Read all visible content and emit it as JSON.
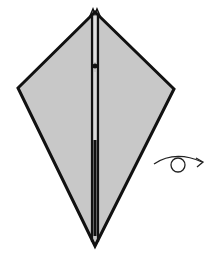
{
  "diagram": {
    "type": "origami-step",
    "paper_color": "#c8c8c8",
    "outline_color": "#111111",
    "background": "#ffffff",
    "kite": {
      "top": [
        95,
        12
      ],
      "left": [
        18,
        88
      ],
      "right": [
        174,
        89
      ],
      "bottom": [
        95,
        246
      ]
    },
    "symbols": [
      {
        "name": "turn-over",
        "meaning": "Turn the model over"
      }
    ]
  }
}
